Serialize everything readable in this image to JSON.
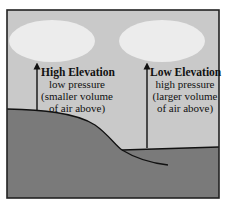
{
  "diagram": {
    "colors": {
      "sky": "#c9c9c9",
      "cloud": "#ececec",
      "ground": "#7a7a7a",
      "frame": "#222222",
      "arrow": "#111111"
    },
    "left": {
      "title": "High Elevation",
      "line1": "low pressure",
      "line2": "(smaller volume",
      "line3": "of air above)"
    },
    "right": {
      "title": "Low Elevation",
      "line1": "high pressure",
      "line2": "(larger volume",
      "line3": "of air above)"
    }
  }
}
